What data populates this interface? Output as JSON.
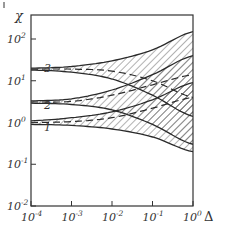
{
  "chart_data": {
    "type": "line",
    "title": "",
    "xlabel": "Δ",
    "ylabel": "χ",
    "xscale": "log",
    "yscale": "log",
    "xlim": [
      0.0001,
      1
    ],
    "ylim": [
      0.01,
      1000
    ],
    "grid": false,
    "x_ticks": [
      "10^-4",
      "10^-3",
      "10^-2",
      "10^-1",
      "10^0"
    ],
    "y_ticks": [
      "10^-2",
      "10^-1",
      "10^0",
      "10^1",
      "10^2"
    ],
    "x_tick_labels": [
      {
        "base": "10",
        "exp": "-4"
      },
      {
        "base": "10",
        "exp": "-3"
      },
      {
        "base": "10",
        "exp": "-2"
      },
      {
        "base": "10",
        "exp": "-1"
      },
      {
        "base": "10",
        "exp": "0"
      }
    ],
    "y_tick_labels": [
      {
        "base": "10",
        "exp": "2"
      },
      {
        "base": "10",
        "exp": "1"
      },
      {
        "base": "10",
        "exp": "0"
      },
      {
        "base": "10",
        "exp": "-1"
      },
      {
        "base": "10",
        "exp": "-2"
      }
    ],
    "curve_labels": [
      "1",
      "2",
      "3"
    ],
    "x": [
      0.0001,
      0.001,
      0.01,
      0.1,
      1
    ],
    "series": [
      {
        "name": "3 upper",
        "style": "solid",
        "values": [
          20,
          22,
          30,
          55,
          150
        ]
      },
      {
        "name": "3 lower",
        "style": "solid",
        "values": [
          18,
          16,
          11,
          4.5,
          1.4
        ]
      },
      {
        "name": "3 dashed",
        "style": "dashed",
        "values": [
          19,
          19,
          17,
          10,
          4
        ]
      },
      {
        "name": "2 upper",
        "style": "solid",
        "values": [
          3.3,
          3.7,
          6,
          14,
          40
        ]
      },
      {
        "name": "2 lower",
        "style": "solid",
        "values": [
          2.9,
          2.7,
          2,
          0.9,
          0.3
        ]
      },
      {
        "name": "2 dashed",
        "style": "dashed",
        "values": [
          3.1,
          3.2,
          4.5,
          8,
          14
        ]
      },
      {
        "name": "1 upper",
        "style": "solid",
        "values": [
          1.1,
          1.3,
          1.8,
          3.5,
          9
        ]
      },
      {
        "name": "1 lower",
        "style": "solid",
        "values": [
          0.9,
          0.85,
          0.7,
          0.45,
          0.2
        ]
      },
      {
        "name": "1 dashed",
        "style": "dashed",
        "values": [
          1.0,
          1.05,
          1.3,
          2.2,
          4
        ]
      }
    ],
    "hatched_region": "between outermost envelope curves of each band",
    "legend": "none (curves labeled 1, 2, 3 inline at left)"
  },
  "axis": {
    "y_symbol": "χ",
    "x_symbol": "Δ"
  },
  "colors": {
    "ink": "#333333",
    "hatch": "#555555",
    "background": "#ffffff"
  }
}
